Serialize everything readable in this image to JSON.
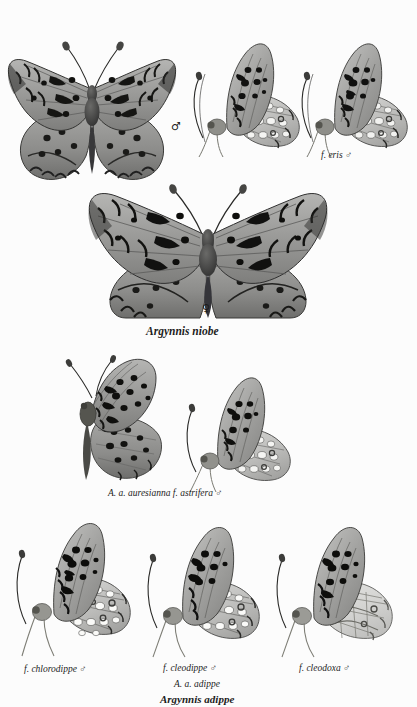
{
  "plate": {
    "kind": "lepidoptera-specimen-plate",
    "background_color": "#fcfcfc",
    "ink_color": "#1c1c1c",
    "width": 417,
    "height": 707
  },
  "sections": {
    "top": {
      "name": "Argynnis niobe upperside and undersides",
      "specimens": [
        {
          "id": "niobe-male-upper",
          "view": "upperside-spread",
          "sex_symbol": "♂"
        },
        {
          "id": "niobe-male-under",
          "view": "underside-lateral",
          "sex_symbol": "♂"
        },
        {
          "id": "niobe-eris-under",
          "view": "underside-lateral",
          "sex_symbol": "♂"
        }
      ]
    },
    "middle": {
      "name": "Argynnis niobe female and forms",
      "specimens": [
        {
          "id": "niobe-female-upper",
          "view": "upperside-spread",
          "sex_symbol": "♀"
        },
        {
          "id": "astrifera-upper",
          "view": "upperside-lateral",
          "sex_symbol": "♂"
        },
        {
          "id": "astrifera-under",
          "view": "underside-lateral",
          "sex_symbol": "♂"
        }
      ]
    },
    "bottom": {
      "name": "Argynnis adippe forms",
      "specimens": [
        {
          "id": "chlorodippe-under",
          "view": "underside-lateral",
          "sex_symbol": "♂"
        },
        {
          "id": "cleodippe-under",
          "view": "underside-lateral",
          "sex_symbol": "♂"
        },
        {
          "id": "cleodoxa-under",
          "view": "underside-lateral",
          "sex_symbol": "♂"
        }
      ]
    }
  },
  "labels": {
    "male_symbol_top": "♂",
    "eris_male": "f. eris  ♂",
    "female_symbol": "♀",
    "argynnis_niobe": "Argynnis niobe",
    "astrifera": "A. a. auresianna f. astrifera  ♂",
    "chlorodippe": "f. chlorodippe  ♂",
    "cleodippe": "f. cleodippe  ♂",
    "cleodoxa": "f. cleodoxa  ♂",
    "aa_adippe": "A. a. adippe",
    "argynnis_adippe": "Argynnis adippe"
  }
}
